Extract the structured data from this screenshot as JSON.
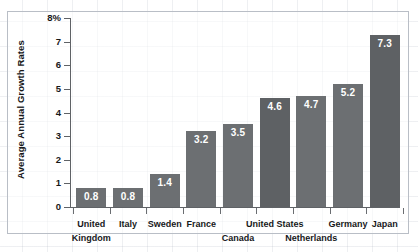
{
  "chart_data": {
    "type": "bar",
    "title": "",
    "subtitle": "",
    "xlabel": "",
    "ylabel": "Average Annual Growth Rates",
    "categories": [
      "United Kingdom",
      "Italy",
      "Sweden",
      "France",
      "Canada",
      "United States",
      "Netherlands",
      "Germany",
      "Japan"
    ],
    "category_lines": [
      [
        "United",
        "Kingdom"
      ],
      [
        "Italy"
      ],
      [
        "Sweden"
      ],
      [
        "France"
      ],
      [
        "Canada"
      ],
      [
        "United States"
      ],
      [
        "Netherlands"
      ],
      [
        "Germany"
      ],
      [
        "Japan"
      ]
    ],
    "values": [
      0.8,
      0.8,
      1.4,
      3.2,
      3.5,
      4.6,
      4.7,
      5.2,
      7.3
    ],
    "value_labels": [
      "0.8",
      "0.8",
      "1.4",
      "3.2",
      "3.5",
      "4.6",
      "4.7",
      "5.2",
      "7.3"
    ],
    "ylim": [
      0,
      8
    ],
    "yticks": [
      0,
      1,
      2,
      3,
      4,
      5,
      6,
      7,
      8
    ],
    "ytick_labels": [
      "0",
      "1",
      "2",
      "3",
      "4",
      "5",
      "6",
      "7",
      "8%"
    ],
    "grid": true,
    "legend": null,
    "bar_color": "#6c6f72",
    "bar_color_alt": "#5e6164",
    "value_label_color": "#ffffff",
    "axis_color": "#5f6266",
    "text_color": "#17181a",
    "background": "#ffffff"
  }
}
